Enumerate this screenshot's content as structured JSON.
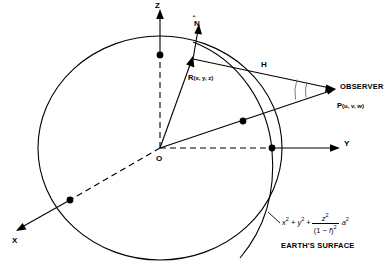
{
  "figure": {
    "type": "geometry-diagram"
  },
  "axes": {
    "z": {
      "label": "Z",
      "direction": "up"
    },
    "y": {
      "label": "Y",
      "direction": "right"
    },
    "x": {
      "label": "X",
      "direction": "lower-left"
    }
  },
  "points": {
    "origin": {
      "label": "O"
    },
    "surface_point": {
      "label": "R",
      "coords": "(x, y, z)"
    },
    "observer": {
      "label": "P",
      "coords": "(u, v, w)",
      "name": "OBSERVER"
    }
  },
  "vectors": {
    "normal": {
      "label": "N",
      "accent": "hat"
    },
    "range": {
      "label": "H"
    }
  },
  "annotations": {
    "surface_caption": "EARTH'S SURFACE",
    "surface_equation": {
      "terms": [
        "x",
        "y",
        "z",
        "a"
      ],
      "flattening": "f",
      "plain": "x^2 + y^2 + z^2/(1 - f)^2 = a^2",
      "lhs_first": "x",
      "lhs_second": "y",
      "numerator": "z",
      "denominator_open": "(1 − ",
      "denominator_var": "f",
      "denominator_close": ")",
      "rhs": "a",
      "exp": "2"
    }
  },
  "colors": {
    "stroke": "#000000",
    "background": "#ffffff"
  }
}
